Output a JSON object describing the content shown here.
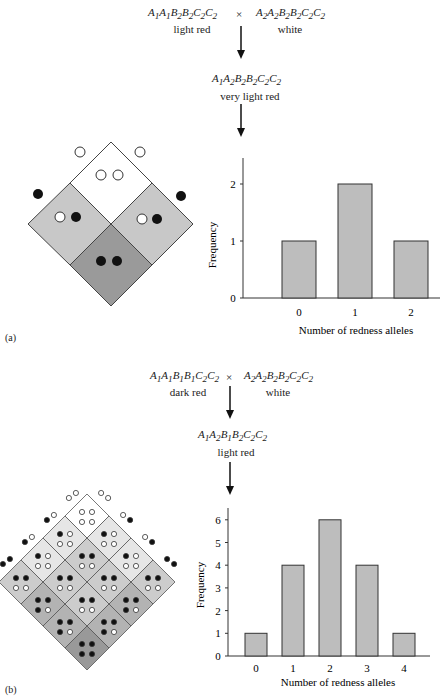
{
  "panel_a": {
    "label": "(a)",
    "parent1": {
      "genotype": "A1A1B2B2C2C2",
      "phenotype": "light red"
    },
    "cross_symbol": "×",
    "parent2": {
      "genotype": "A2A2B2B2C2C2",
      "phenotype": "white"
    },
    "f1": {
      "genotype": "A1A2B2B2C2C2",
      "phenotype": "very light red"
    }
  },
  "panel_b": {
    "label": "(b)",
    "parent1": {
      "genotype": "A1A1B1B1C2C2",
      "phenotype": "dark red"
    },
    "cross_symbol": "×",
    "parent2": {
      "genotype": "A2A2B2B2C2C2",
      "phenotype": "white"
    },
    "f1": {
      "genotype": "A1A2B1B2C2C2",
      "phenotype": "light red"
    }
  },
  "chart_data": [
    {
      "type": "bar",
      "title": "",
      "categories": [
        "0",
        "1",
        "2"
      ],
      "values": [
        1,
        2,
        1
      ],
      "xlabel": "Number of redness alleles",
      "ylabel": "Frequency",
      "yticks": [
        0,
        1,
        2
      ],
      "ylim": [
        0,
        2.5
      ],
      "grid": false,
      "bar_color": "#bdbdbd"
    },
    {
      "type": "bar",
      "title": "",
      "categories": [
        "0",
        "1",
        "2",
        "3",
        "4"
      ],
      "values": [
        1,
        4,
        6,
        4,
        1
      ],
      "xlabel": "Number of redness alleles",
      "ylabel": "Frequency",
      "yticks": [
        0,
        1,
        2,
        3,
        4,
        5,
        6
      ],
      "ylim": [
        0,
        6.5
      ],
      "grid": false,
      "bar_color": "#bdbdbd"
    }
  ],
  "colors": {
    "shade_0": "#ffffff",
    "shade_1": "#e6e6e6",
    "shade_2": "#cccccc",
    "shade_3": "#b3b3b3",
    "shade_4": "#999999",
    "a_shade_1": "#c8c8c8",
    "a_shade_2": "#9a9a9a"
  }
}
